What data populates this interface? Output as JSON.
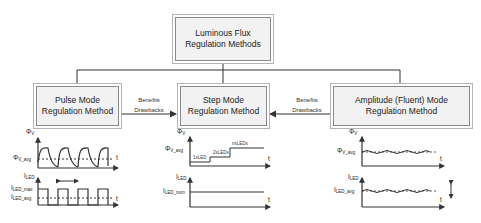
{
  "diagram": {
    "root": {
      "line1": "Luminous Flux",
      "line2": "Regulation Methods"
    },
    "methods": [
      {
        "line1": "Pulse Mode",
        "line2": "Regulation Method"
      },
      {
        "line1": "Step Mode",
        "line2": "Regulation Method"
      },
      {
        "line1": "Amplitude (Fluent) Mode",
        "line2": "Regulation Method"
      }
    ],
    "connectors": [
      {
        "benefits": "Benefits",
        "drawbacks": "Drawbacks"
      },
      {
        "benefits": "Benefits",
        "drawbacks": "Drawbacks"
      }
    ]
  },
  "plots": {
    "pulse": {
      "flux_axis": "Φ",
      "flux_sub": "V",
      "flux_avg": "Φ",
      "flux_avg_sub": "V_avg",
      "current_axis": "I",
      "current_sub": "LED",
      "current_max": "I",
      "current_max_sub": "LED_max",
      "current_avg": "I",
      "current_avg_sub": "LED_avg",
      "t": "t"
    },
    "step": {
      "flux_axis": "Φ",
      "flux_sub": "V",
      "flux_avg": "Φ",
      "flux_avg_sub": "V_avg",
      "step_labels": [
        "1xLED",
        "2xLEDs",
        "nxLEDs"
      ],
      "current_axis": "I",
      "current_sub": "LED",
      "current_nom": "I",
      "current_nom_sub": "LED_nom",
      "t": "t"
    },
    "amplitude": {
      "flux_axis": "Φ",
      "flux_sub": "V",
      "flux_avg": "Φ",
      "flux_avg_sub": "V_avg",
      "current_axis": "I",
      "current_sub": "LED",
      "current_avg": "I",
      "current_avg_sub": "LED_avg",
      "t": "t"
    }
  }
}
